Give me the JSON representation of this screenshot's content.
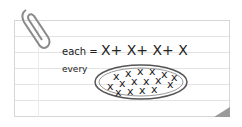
{
  "note": {
    "line1_label": "each =",
    "line1_expr": "X+ X+ X+ X",
    "line2_label": "every",
    "group_content": "XXXXXXXXXXXXXXXX"
  }
}
